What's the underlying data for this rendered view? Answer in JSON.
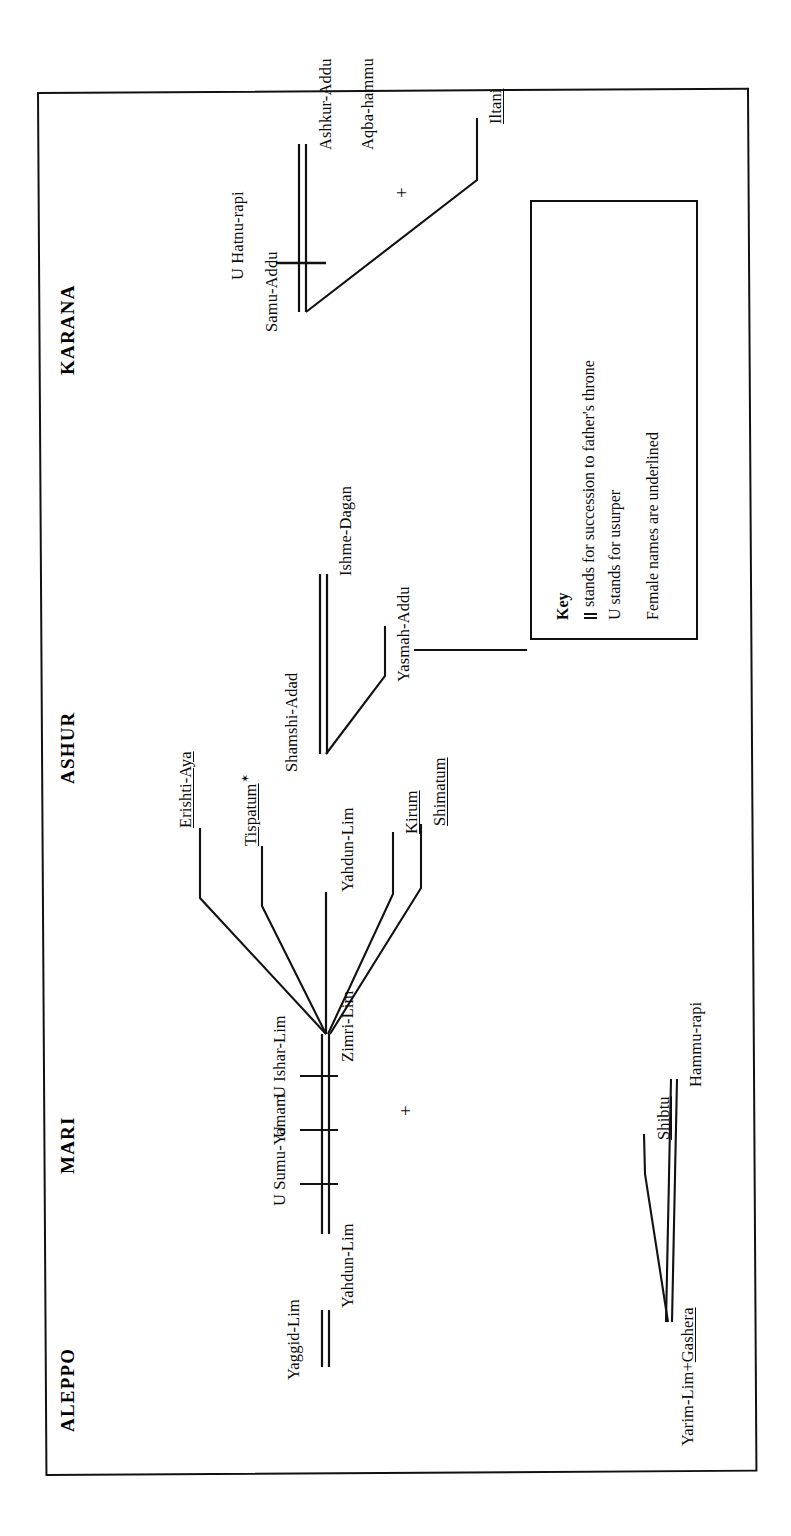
{
  "document": {
    "type": "dynastic-genealogy-chart",
    "orientation": "rotated-90-counterclockwise",
    "column_headings": [
      "ALEPPO",
      "MARI",
      "ASHUR",
      "KARANA"
    ]
  },
  "headings": {
    "aleppo": "ALEPPO",
    "mari": "MARI",
    "ashur": "ASHUR",
    "karana": "KARANA"
  },
  "aleppo": {
    "root": "Yarim-Lim+",
    "root_wife": "Gashera",
    "child_daughter": "Shibtu",
    "child_son": "Hammu-rapi"
  },
  "mari": {
    "yaggid_lim": "Yaggid-Lim",
    "yahdun_lim": "Yahdun-Lim",
    "usurper_1": "U Sumu-Yamam",
    "usurper_2": "U",
    "usurper_3": "U Ishar-Lim",
    "zimri_lim": "Zimri-Lim",
    "marriage_sign": "+",
    "spouse": "Shibtu",
    "children": [
      "Erishti-Aya",
      "Tispatum",
      "Yahdun-Lim",
      "Kirum",
      "Shimatum"
    ],
    "tispatum_marker": "✶"
  },
  "ashur": {
    "shamshi_adad": "Shamshi-Adad",
    "ishme_dagan": "Ishme-Dagan",
    "yasmah_addu": "Yasmah-Addu"
  },
  "karana": {
    "samu_addu": "Samu-Addu",
    "usurper": "U Hatnu-rapi",
    "ashkur_addu": "Ashkur-Addu",
    "iltani": "Iltani",
    "marriage_sign": "+",
    "aqba_hammu": "Aqba-hammu"
  },
  "key": {
    "title": "Key",
    "line1_glyph": "=",
    "line1": "stands for succession to father's throne",
    "line2": "U stands for usurper",
    "line3": "Female names are underlined"
  },
  "colors": {
    "ink": "#111111",
    "paper": "#ffffff"
  }
}
